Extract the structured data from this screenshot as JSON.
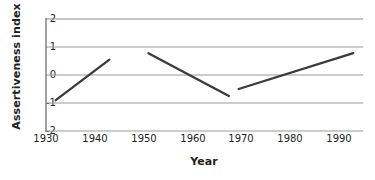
{
  "chart_data": {
    "type": "line",
    "title": "",
    "xlabel": "Year",
    "ylabel": "Assertiveness index",
    "xlim": [
      1930,
      1995
    ],
    "ylim": [
      -2,
      2
    ],
    "xticks": [
      1930,
      1940,
      1950,
      1960,
      1970,
      1980,
      1990
    ],
    "yticks": [
      2,
      1,
      0,
      -1,
      -2
    ],
    "grid": "horizontal",
    "legend": "none",
    "series": [
      {
        "name": "segment-1",
        "points": [
          {
            "x": 1932,
            "y": -0.9
          },
          {
            "x": 1943,
            "y": 0.55
          }
        ]
      },
      {
        "name": "segment-2",
        "points": [
          {
            "x": 1951,
            "y": 0.78
          },
          {
            "x": 1967.5,
            "y": -0.75
          }
        ]
      },
      {
        "name": "segment-3",
        "points": [
          {
            "x": 1969.5,
            "y": -0.5
          },
          {
            "x": 1993,
            "y": 0.78
          }
        ]
      }
    ],
    "colors": {
      "line": "#3b3b3b",
      "grid": "#9a9a9a",
      "axis": "#6e6e6e",
      "text": "#231f20"
    }
  }
}
